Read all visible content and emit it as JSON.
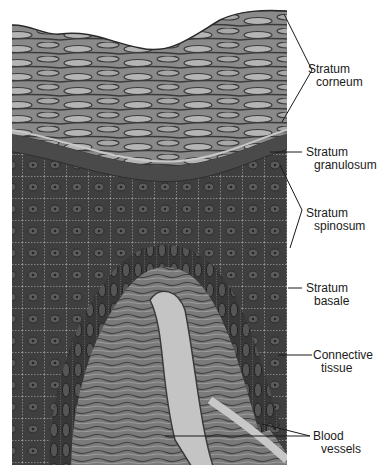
{
  "figure": {
    "colors": {
      "background": "#ffffff",
      "tissue_dark": "#3a3a3a",
      "tissue_mid": "#6e6e6e",
      "tissue_light": "#b8b8b8",
      "leader_line": "#1a1a1a",
      "label_text": "#1a1a1a"
    }
  },
  "labels": [
    {
      "id": "stratum-corneum",
      "line1": "Stratum",
      "line2": "corneum"
    },
    {
      "id": "stratum-granulosum",
      "line1": "Stratum",
      "line2": "granulosum"
    },
    {
      "id": "stratum-spinosum",
      "line1": "Stratum",
      "line2": "spinosum"
    },
    {
      "id": "stratum-basale",
      "line1": "Stratum",
      "line2": "basale"
    },
    {
      "id": "connective-tissue",
      "line1": "Connective",
      "line2": "tissue"
    },
    {
      "id": "blood-vessels",
      "line1": "Blood",
      "line2": "vessels"
    }
  ]
}
